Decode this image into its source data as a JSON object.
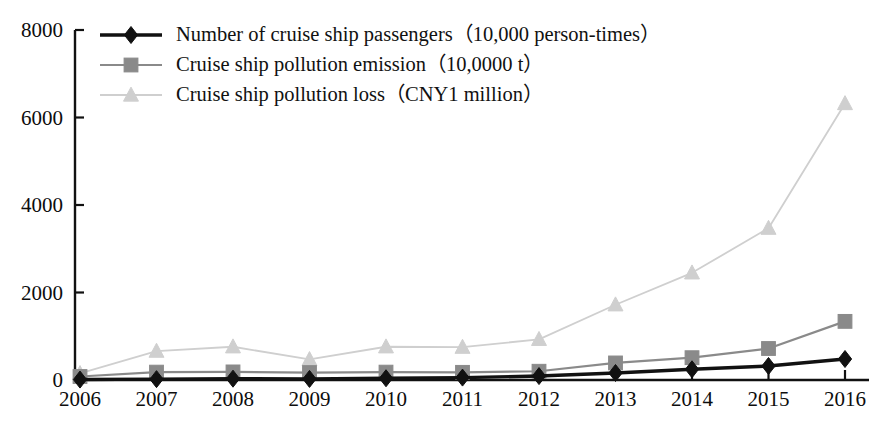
{
  "chart_data": {
    "type": "line",
    "title": "",
    "subtitle": "",
    "xlabel": "",
    "ylabel": "",
    "categories": [
      "2006",
      "2007",
      "2008",
      "2009",
      "2010",
      "2011",
      "2012",
      "2013",
      "2014",
      "2015",
      "2016"
    ],
    "x": [
      2006,
      2007,
      2008,
      2009,
      2010,
      2011,
      2012,
      2013,
      2014,
      2015,
      2016
    ],
    "ylim": [
      0,
      8000
    ],
    "xlim": [
      2006,
      2016
    ],
    "yticks": [
      0,
      2000,
      4000,
      6000,
      8000
    ],
    "ytick_labels": [
      "0",
      "2000",
      "4000",
      "6000",
      "8000"
    ],
    "xtick_labels": [
      "2006",
      "2007",
      "2008",
      "2009",
      "2010",
      "2011",
      "2012",
      "2013",
      "2014",
      "2015",
      "2016"
    ],
    "grid": false,
    "legend_position": "top-left",
    "series": [
      {
        "name": "Number of cruise ship passengers（10,000 person-times）",
        "marker": "diamond",
        "color": "#111111",
        "values": [
          10,
          20,
          30,
          25,
          40,
          55,
          90,
          160,
          245,
          320,
          480
        ]
      },
      {
        "name": "Cruise ship pollution emission（10,0000 t）",
        "marker": "square",
        "color": "#8a8a8a",
        "values": [
          80,
          180,
          185,
          170,
          180,
          175,
          200,
          390,
          510,
          720,
          1340
        ]
      },
      {
        "name": "Cruise ship pollution loss（CNY1 million）",
        "marker": "triangle",
        "color": "#cfcfcf",
        "values": [
          150,
          660,
          760,
          470,
          760,
          750,
          930,
          1720,
          2450,
          3470,
          6320
        ]
      }
    ]
  },
  "legend": {
    "items": [
      {
        "label": "Number of cruise ship passengers（10,000 person-times）",
        "marker": "diamond",
        "color": "#111111"
      },
      {
        "label": "Cruise ship pollution emission（10,0000 t）",
        "marker": "square",
        "color": "#8a8a8a"
      },
      {
        "label": "Cruise ship pollution loss（CNY1 million）",
        "marker": "triangle",
        "color": "#cfcfcf"
      }
    ]
  },
  "axes": {
    "y_labels": [
      "8000",
      "6000",
      "4000",
      "2000",
      "0"
    ],
    "x_labels": [
      "2006",
      "2007",
      "2008",
      "2009",
      "2010",
      "2011",
      "2012",
      "2013",
      "2014",
      "2015",
      "2016"
    ]
  }
}
